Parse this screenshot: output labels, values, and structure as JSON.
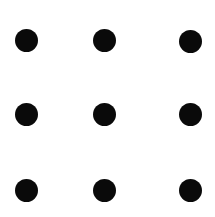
{
  "diagram": {
    "type": "dot-grid",
    "rows": 3,
    "cols": 3,
    "background": "#ffffff",
    "dot_color": "#0a0a0a",
    "dot_diameter": 23,
    "column_centers_x": [
      26,
      104,
      190
    ],
    "row_centers_y": [
      40,
      114,
      190
    ],
    "dots": [
      {
        "row": 0,
        "col": 0,
        "x": 26,
        "y": 40
      },
      {
        "row": 0,
        "col": 1,
        "x": 104,
        "y": 40
      },
      {
        "row": 0,
        "col": 2,
        "x": 190,
        "y": 41
      },
      {
        "row": 1,
        "col": 0,
        "x": 26,
        "y": 114
      },
      {
        "row": 1,
        "col": 1,
        "x": 104,
        "y": 114
      },
      {
        "row": 1,
        "col": 2,
        "x": 190,
        "y": 114
      },
      {
        "row": 2,
        "col": 0,
        "x": 26,
        "y": 190
      },
      {
        "row": 2,
        "col": 1,
        "x": 104,
        "y": 190
      },
      {
        "row": 2,
        "col": 2,
        "x": 190,
        "y": 190
      }
    ]
  }
}
